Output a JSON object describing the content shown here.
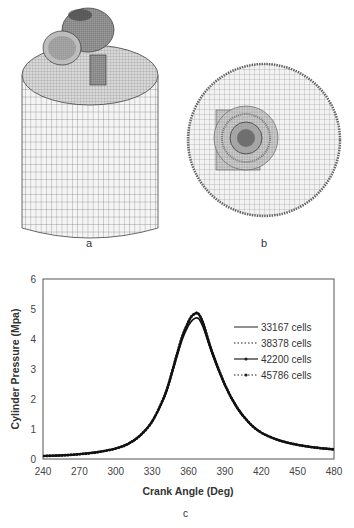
{
  "panels": {
    "a": {
      "label": "a",
      "description": "3D cylinder mesh with valve port"
    },
    "b": {
      "label": "b",
      "description": "Top-view circular mesh"
    },
    "c": {
      "label": "c"
    }
  },
  "chart_data": {
    "type": "line",
    "title": "",
    "xlabel": "Crank Angle (Deg)",
    "ylabel": "Cylinder Pressure (Mpa)",
    "xlim": [
      240,
      480
    ],
    "ylim": [
      0,
      6
    ],
    "xticks": [
      240,
      270,
      300,
      330,
      360,
      390,
      420,
      450,
      480
    ],
    "yticks": [
      0,
      1,
      2,
      3,
      4,
      5,
      6
    ],
    "grid": false,
    "legend_position": "upper right inside",
    "x": [
      240,
      255,
      270,
      285,
      300,
      310,
      320,
      330,
      340,
      345,
      350,
      355,
      360,
      363,
      366,
      367,
      369,
      372,
      375,
      380,
      390,
      400,
      410,
      420,
      435,
      450,
      465,
      480
    ],
    "series": [
      {
        "name": "33167 cells",
        "style": "solid",
        "values": [
          0.1,
          0.12,
          0.16,
          0.23,
          0.35,
          0.5,
          0.78,
          1.25,
          2.05,
          2.65,
          3.35,
          4.0,
          4.45,
          4.62,
          4.7,
          4.7,
          4.65,
          4.4,
          4.05,
          3.45,
          2.45,
          1.7,
          1.2,
          0.88,
          0.62,
          0.47,
          0.38,
          0.32
        ]
      },
      {
        "name": "38378 cells",
        "style": "dotted",
        "values": [
          0.1,
          0.12,
          0.16,
          0.23,
          0.35,
          0.5,
          0.78,
          1.25,
          2.07,
          2.68,
          3.4,
          4.08,
          4.55,
          4.75,
          4.83,
          4.84,
          4.78,
          4.52,
          4.12,
          3.5,
          2.47,
          1.72,
          1.21,
          0.88,
          0.62,
          0.47,
          0.38,
          0.32
        ]
      },
      {
        "name": "42200 cells",
        "style": "solid-marker",
        "values": [
          0.1,
          0.12,
          0.16,
          0.23,
          0.35,
          0.5,
          0.78,
          1.25,
          2.08,
          2.7,
          3.42,
          4.1,
          4.58,
          4.78,
          4.86,
          4.87,
          4.8,
          4.54,
          4.14,
          3.51,
          2.48,
          1.72,
          1.21,
          0.88,
          0.62,
          0.47,
          0.38,
          0.32
        ]
      },
      {
        "name": "45786 cells",
        "style": "dotted-marker",
        "values": [
          0.1,
          0.12,
          0.16,
          0.23,
          0.35,
          0.5,
          0.78,
          1.25,
          2.08,
          2.7,
          3.42,
          4.1,
          4.58,
          4.78,
          4.86,
          4.87,
          4.8,
          4.54,
          4.14,
          3.51,
          2.48,
          1.72,
          1.21,
          0.88,
          0.62,
          0.47,
          0.38,
          0.32
        ]
      }
    ]
  }
}
